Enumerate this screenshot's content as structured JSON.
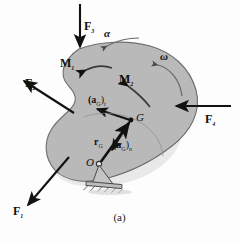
{
  "figure": {
    "caption": "(a)",
    "body_fill": "#b9b9b9",
    "body_stroke": "#6d6d6d",
    "ink": "#111111",
    "curve_ink": "#555555"
  },
  "forces": [
    {
      "id": "F1",
      "name": "F",
      "sub": "1",
      "direction": "down-left",
      "x1": 68,
      "y1": 158,
      "x2": 26,
      "y2": 207
    },
    {
      "id": "F2",
      "name": "F",
      "sub": "2",
      "direction": "up-left",
      "x1": 73,
      "y1": 112,
      "x2": 22,
      "y2": 80
    },
    {
      "id": "F3",
      "name": "F",
      "sub": "3",
      "direction": "down",
      "x1": 80,
      "y1": 4,
      "x2": 80,
      "y2": 48
    },
    {
      "id": "F4",
      "name": "F",
      "sub": "4",
      "direction": "left",
      "x1": 229,
      "y1": 106,
      "x2": 174,
      "y2": 106
    }
  ],
  "moments": [
    {
      "id": "M1",
      "name": "M",
      "sub": "1",
      "sense": "counterclockwise"
    },
    {
      "id": "M2",
      "name": "M",
      "sub": "2",
      "sense": "counterclockwise"
    }
  ],
  "kinematics": [
    {
      "id": "alpha",
      "symbol": "α",
      "meaning": "angular-acceleration"
    },
    {
      "id": "omega",
      "symbol": "ω",
      "meaning": "angular-velocity"
    }
  ],
  "points": [
    {
      "id": "G",
      "label": "G",
      "role": "mass-center",
      "x": 131,
      "y": 120
    },
    {
      "id": "O",
      "label": "O",
      "role": "pin-support",
      "x": 99,
      "y": 164
    }
  ],
  "vectors": [
    {
      "id": "aGt",
      "label_main": "(a",
      "label_sub1": "G",
      "label_mid": ")",
      "label_sub2": "t",
      "full": "(aG)t",
      "meaning": "tangential-acceleration"
    },
    {
      "id": "aGn",
      "label_main": "(a",
      "label_sub1": "G",
      "label_mid": ")",
      "label_sub2": "n",
      "full": "(aG)n",
      "meaning": "normal-acceleration"
    },
    {
      "id": "rG",
      "label_main": "r",
      "label_sub1": "G",
      "full": "rG",
      "meaning": "position-vector-O-to-G"
    }
  ],
  "labels": {
    "F1": "F",
    "F1_sub": "1",
    "F2": "F",
    "F2_sub": "2",
    "F3": "F",
    "F3_sub": "3",
    "F4": "F",
    "F4_sub": "4",
    "M1": "M",
    "M1_sub": "1",
    "M2": "M",
    "M2_sub": "2",
    "alpha": "α",
    "omega": "ω",
    "G": "G",
    "O": "O",
    "aG_open": "(a",
    "aG_G": "G",
    "aG_close_t": ")",
    "aG_t": "t",
    "aG_n": "n",
    "rG_r": "r",
    "rG_G": "G",
    "caption": "(a)"
  }
}
